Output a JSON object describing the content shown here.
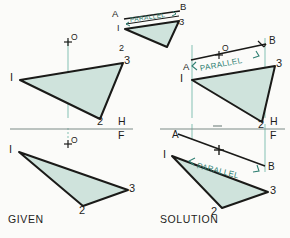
{
  "figure": {
    "title_given": "GIVEN",
    "title_solution": "SOLUTION",
    "fold_line_top": "H",
    "fold_line_bottom": "F",
    "colors": {
      "background": "#fbfbf9",
      "triangle_fill": "#cfe3dc",
      "triangle_edge": "#1a1a18",
      "construction_line": "#8fc6bb",
      "annotation_text": "#2f7f72",
      "label_text": "#1d1d1b",
      "reference_line": "#7d8b87"
    },
    "annotation_label": "PARALLEL",
    "point_o_label": "O",
    "point_a_label": "A",
    "point_b_label": "B"
  },
  "panels": {
    "given": {
      "name": "GIVEN",
      "top_view": {
        "vertex_1": "I",
        "vertex_2": "2",
        "vertex_3": "3",
        "point_o": "O"
      },
      "front_view": {
        "vertex_1": "I",
        "vertex_2": "2",
        "vertex_3": "3",
        "point_o": "O"
      }
    },
    "solution": {
      "name": "SOLUTION",
      "inset_view": {
        "label_a": "A",
        "label_b": "B",
        "vertex_1": "I",
        "vertex_2": "2",
        "vertex_3": "3",
        "annotation": "PARALLEL"
      },
      "top_view": {
        "label_a": "A",
        "label_b": "B",
        "point_o": "O",
        "vertex_1": "I",
        "vertex_2": "2",
        "vertex_3": "3",
        "annotation": "PARALLEL"
      },
      "front_view": {
        "label_a": "A",
        "label_b": "B",
        "vertex_1": "I",
        "vertex_2": "2",
        "vertex_3": "3",
        "annotation": "PARALLEL"
      }
    }
  }
}
